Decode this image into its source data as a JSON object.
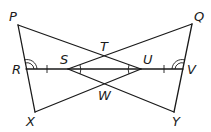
{
  "diagram": {
    "type": "geometry-figure",
    "points": {
      "P": {
        "label": "P",
        "x": 18,
        "y": 25
      },
      "Q": {
        "label": "Q",
        "x": 192,
        "y": 24
      },
      "R": {
        "label": "R",
        "x": 26,
        "y": 69
      },
      "S": {
        "label": "S",
        "x": 68,
        "y": 69
      },
      "T": {
        "label": "T",
        "x": 105,
        "y": 55
      },
      "U": {
        "label": "U",
        "x": 141,
        "y": 69
      },
      "V": {
        "label": "V",
        "x": 183,
        "y": 69
      },
      "W": {
        "label": "W",
        "x": 105,
        "y": 83
      },
      "X": {
        "label": "X",
        "x": 35,
        "y": 112
      },
      "Y": {
        "label": "Y",
        "x": 174,
        "y": 112
      }
    },
    "segments": [
      "PX",
      "QY",
      "PU",
      "QS",
      "XU",
      "YS",
      "RV"
    ],
    "marks": {
      "congruent_ticks": [
        "RS",
        "UV"
      ],
      "double_arcs": [
        "angle PRS",
        "angle QVU"
      ],
      "single_arcs": [
        "angle TSW",
        "angle TUW"
      ]
    },
    "labels": [
      "P",
      "Q",
      "R",
      "S",
      "T",
      "U",
      "V",
      "W",
      "X",
      "Y"
    ]
  }
}
